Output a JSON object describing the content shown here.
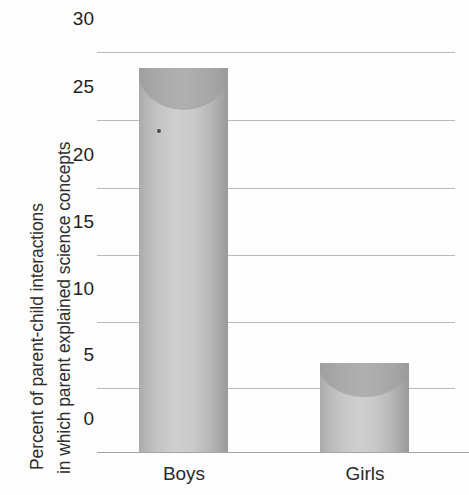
{
  "chart_data": {
    "type": "bar",
    "title": "",
    "subtitle": "",
    "categories": [
      "Boys",
      "Girls"
    ],
    "values": [
      28.8,
      6.7
    ],
    "series": [
      {
        "name": "Percent of parent-child interactions",
        "values": [
          28.8,
          6.7
        ]
      }
    ],
    "xlabel": "",
    "ylabel": "Percent of parent-child interactions in which parent explained science concepts",
    "ylabel_lines": [
      "Percent of parent-child interactions",
      "in which parent explained science concepts"
    ],
    "ylim": [
      0,
      30
    ],
    "ytick_step": 5,
    "ytick_labels": [
      "30",
      "25",
      "20",
      "15",
      "10",
      "5",
      "0"
    ],
    "ytick_values": [
      30,
      25,
      20,
      15,
      10,
      5,
      0
    ],
    "grid": true,
    "grid_orientation": "horizontal",
    "legend": false,
    "legend_position": "none",
    "bar_style": "3d-cylinder",
    "annotations": []
  },
  "colors": {
    "background": "#fdfdfd",
    "gridline": "#b9b9b9",
    "baseline": "#a3a3a3",
    "bar_light": "#cfcfcf",
    "bar_mid": "#b8b8b8",
    "bar_dark": "#9a9a9a",
    "bar_top": "#a6a6a6",
    "text": "#1f1f1f"
  },
  "artifacts": {
    "speck_label": "scan-speck"
  }
}
